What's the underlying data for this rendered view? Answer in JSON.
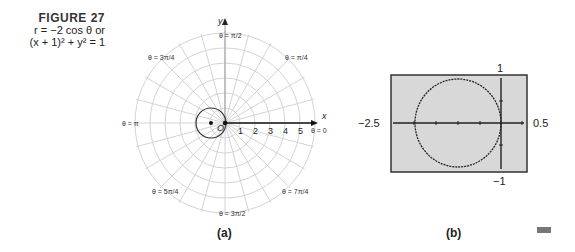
{
  "figure": {
    "label": "FIGURE 27",
    "eq_line1": "r = −2 cos θ or",
    "eq_line2": "(x + 1)² + y² = 1"
  },
  "panel_a": {
    "caption": "(a)",
    "x_axis_label": "x",
    "y_axis_label": "y",
    "origin_label": "O",
    "radial_ticks": [
      "1",
      "2",
      "3",
      "4",
      "5"
    ],
    "angle_labels": {
      "theta_0": "θ = 0",
      "theta_pi_4": "θ = π/4",
      "theta_pi_2": "θ = π/2",
      "theta_3pi_4": "θ = 3π/4",
      "theta_pi": "θ = π",
      "theta_5pi_4": "θ = 5π/4",
      "theta_3pi_2": "θ = 3π/2",
      "theta_7pi_4": "θ = 7π/4"
    }
  },
  "panel_b": {
    "caption": "(b)",
    "xmin_label": "−2.5",
    "xmax_label": "0.5",
    "ymax_label": "1",
    "ymin_label": "−1"
  },
  "chart_data": [
    {
      "type": "line",
      "title": "r = −2 cos θ (polar graph)",
      "coordinate_system": "polar",
      "equation_polar": "r = -2 cos(theta)",
      "equation_rect": "(x + 1)^2 + y^2 = 1",
      "circle": {
        "center": [
          -1,
          0
        ],
        "radius": 1
      },
      "radial_tick_labels": [
        1,
        2,
        3,
        4,
        5
      ],
      "angle_labels": [
        "θ = 0",
        "θ = π/4",
        "θ = π/2",
        "θ = 3π/4",
        "θ = π",
        "θ = 5π/4",
        "θ = 3π/2",
        "θ = 7π/4"
      ],
      "grid": true
    },
    {
      "type": "line",
      "title": "Graphing utility view",
      "xlim": [
        -2.5,
        0.5
      ],
      "ylim": [
        -1,
        1
      ],
      "circle": {
        "center": [
          -1,
          0
        ],
        "radius": 1
      },
      "grid": false
    }
  ]
}
